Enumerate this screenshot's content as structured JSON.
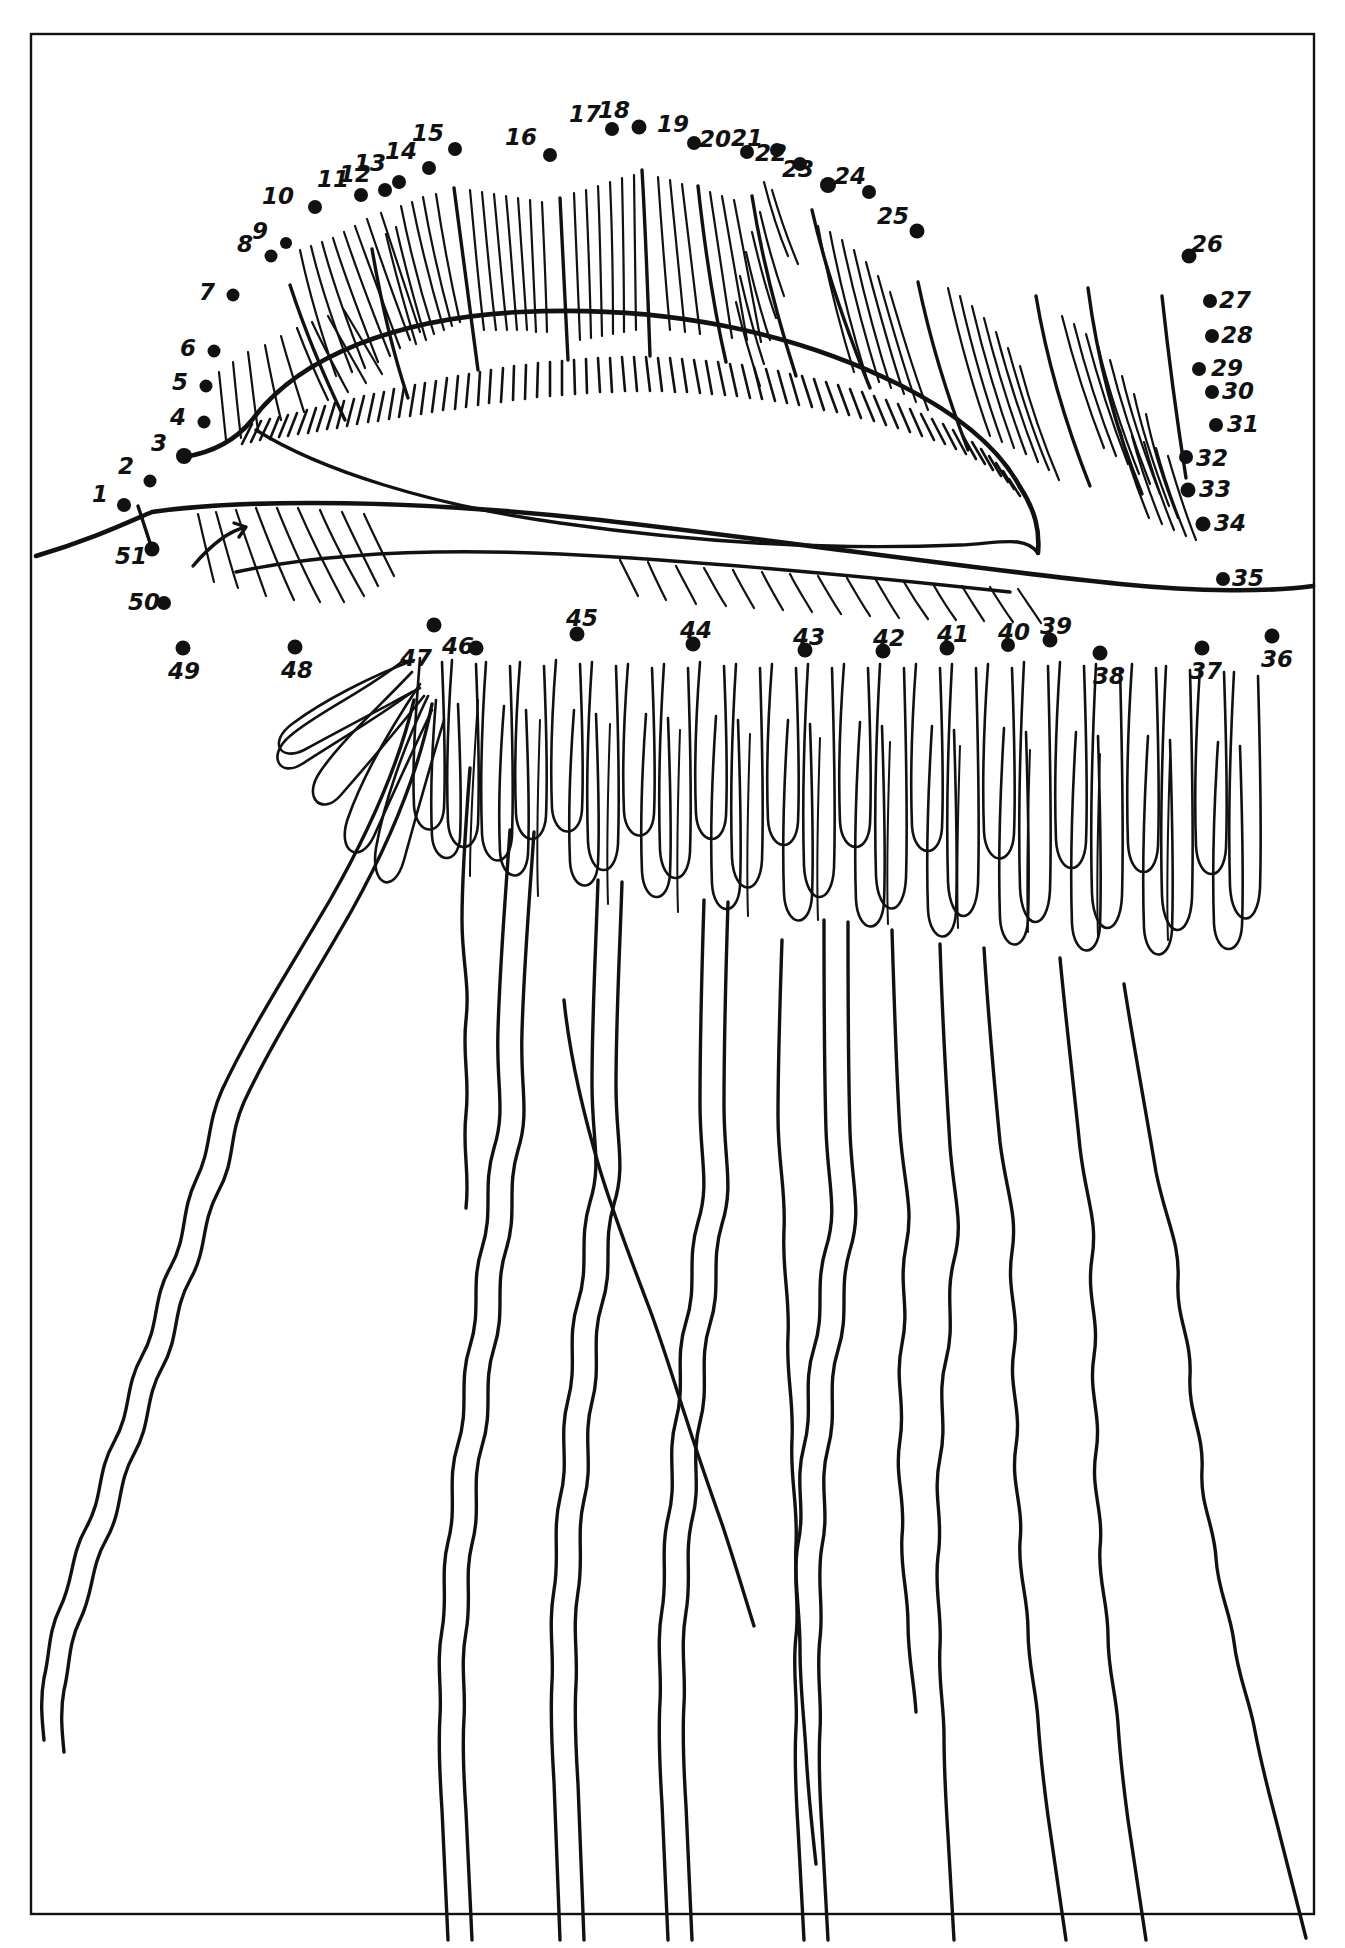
{
  "page": {
    "kind": "connect-the-dots-puzzle",
    "background_color": "#ffffff",
    "ink_color": "#111111",
    "border": {
      "present": true,
      "x": 30,
      "y": 33,
      "width": 1285,
      "height": 1882,
      "stroke": "#111111",
      "stroke_width": 2
    }
  },
  "subject": {
    "name": "jellyfish",
    "description": "Hand-drawn line art of a jellyfish: a broad domed bell with hatched rim at top, a row of short marginal tentacles, and long wavy trailing tentacles filling the lower two thirds of the frame."
  },
  "dots": [
    {
      "n": "1",
      "cx": 124,
      "cy": 505,
      "r": 7,
      "label_x": 108,
      "label_y": 483,
      "label_align": "right"
    },
    {
      "n": "2",
      "cx": 150,
      "cy": 481,
      "r": 6.5,
      "label_x": 134,
      "label_y": 455,
      "label_align": "right"
    },
    {
      "n": "3",
      "cx": 184,
      "cy": 456,
      "r": 8,
      "label_x": 167,
      "label_y": 432,
      "label_align": "right"
    },
    {
      "n": "4",
      "cx": 204,
      "cy": 422,
      "r": 6.5,
      "label_x": 186,
      "label_y": 406,
      "label_align": "right"
    },
    {
      "n": "5",
      "cx": 206,
      "cy": 386,
      "r": 6.5,
      "label_x": 188,
      "label_y": 371,
      "label_align": "right"
    },
    {
      "n": "6",
      "cx": 214,
      "cy": 351,
      "r": 6.5,
      "label_x": 196,
      "label_y": 337,
      "label_align": "right"
    },
    {
      "n": "7",
      "cx": 233,
      "cy": 295,
      "r": 6.5,
      "label_x": 215,
      "label_y": 281,
      "label_align": "right"
    },
    {
      "n": "8",
      "cx": 271,
      "cy": 256,
      "r": 6.5,
      "label_x": 253,
      "label_y": 233,
      "label_align": "right"
    },
    {
      "n": "9",
      "cx": 286,
      "cy": 243,
      "r": 6,
      "label_x": 268,
      "label_y": 220,
      "label_align": "right"
    },
    {
      "n": "10",
      "cx": 315,
      "cy": 207,
      "r": 7,
      "label_x": 294,
      "label_y": 185,
      "label_align": "right"
    },
    {
      "n": "11",
      "cx": 361,
      "cy": 195,
      "r": 7,
      "label_x": 349,
      "label_y": 168,
      "label_align": "right"
    },
    {
      "n": "12",
      "cx": 385,
      "cy": 190,
      "r": 7,
      "label_x": 371,
      "label_y": 163,
      "label_align": "right"
    },
    {
      "n": "13",
      "cx": 399,
      "cy": 182,
      "r": 7,
      "label_x": 386,
      "label_y": 152,
      "label_align": "right"
    },
    {
      "n": "14",
      "cx": 429,
      "cy": 168,
      "r": 7,
      "label_x": 417,
      "label_y": 140,
      "label_align": "right"
    },
    {
      "n": "15",
      "cx": 455,
      "cy": 149,
      "r": 7,
      "label_x": 444,
      "label_y": 122,
      "label_align": "right"
    },
    {
      "n": "16",
      "cx": 550,
      "cy": 155,
      "r": 7,
      "label_x": 537,
      "label_y": 126,
      "label_align": "right"
    },
    {
      "n": "17",
      "cx": 612,
      "cy": 129,
      "r": 7,
      "label_x": 601,
      "label_y": 103,
      "label_align": "right"
    },
    {
      "n": "18",
      "cx": 639,
      "cy": 127,
      "r": 7.5,
      "label_x": 630,
      "label_y": 99,
      "label_align": "right"
    },
    {
      "n": "19",
      "cx": 694,
      "cy": 143,
      "r": 7,
      "label_x": 689,
      "label_y": 113,
      "label_align": "right"
    },
    {
      "n": "20",
      "cx": 747,
      "cy": 152,
      "r": 7,
      "label_x": 731,
      "label_y": 128,
      "label_align": "right"
    },
    {
      "n": "21",
      "cx": 777,
      "cy": 150,
      "r": 7,
      "label_x": 763,
      "label_y": 127,
      "label_align": "right"
    },
    {
      "n": "22",
      "cx": 800,
      "cy": 164,
      "r": 7,
      "label_x": 787,
      "label_y": 142,
      "label_align": "right"
    },
    {
      "n": "23",
      "cx": 828,
      "cy": 185,
      "r": 8,
      "label_x": 814,
      "label_y": 158,
      "label_align": "right"
    },
    {
      "n": "24",
      "cx": 869,
      "cy": 192,
      "r": 7,
      "label_x": 866,
      "label_y": 165,
      "label_align": "right"
    },
    {
      "n": "25",
      "cx": 917,
      "cy": 231,
      "r": 7.5,
      "label_x": 909,
      "label_y": 205,
      "label_align": "right"
    },
    {
      "n": "26",
      "cx": 1189,
      "cy": 256,
      "r": 7.5,
      "label_x": 1191,
      "label_y": 233,
      "label_align": "left"
    },
    {
      "n": "27",
      "cx": 1210,
      "cy": 301,
      "r": 7,
      "label_x": 1219,
      "label_y": 289,
      "label_align": "left"
    },
    {
      "n": "28",
      "cx": 1212,
      "cy": 336,
      "r": 7,
      "label_x": 1221,
      "label_y": 324,
      "label_align": "left"
    },
    {
      "n": "29",
      "cx": 1199,
      "cy": 369,
      "r": 7,
      "label_x": 1211,
      "label_y": 357,
      "label_align": "left"
    },
    {
      "n": "30",
      "cx": 1212,
      "cy": 392,
      "r": 7,
      "label_x": 1222,
      "label_y": 380,
      "label_align": "left"
    },
    {
      "n": "31",
      "cx": 1216,
      "cy": 425,
      "r": 7,
      "label_x": 1227,
      "label_y": 413,
      "label_align": "left"
    },
    {
      "n": "32",
      "cx": 1186,
      "cy": 457,
      "r": 7,
      "label_x": 1196,
      "label_y": 447,
      "label_align": "left"
    },
    {
      "n": "33",
      "cx": 1188,
      "cy": 490,
      "r": 7.5,
      "label_x": 1199,
      "label_y": 478,
      "label_align": "left"
    },
    {
      "n": "34",
      "cx": 1203,
      "cy": 524,
      "r": 7.5,
      "label_x": 1214,
      "label_y": 512,
      "label_align": "left"
    },
    {
      "n": "35",
      "cx": 1223,
      "cy": 579,
      "r": 7,
      "label_x": 1232,
      "label_y": 567,
      "label_align": "left"
    },
    {
      "n": "36",
      "cx": 1272,
      "cy": 636,
      "r": 7.5,
      "label_x": 1261,
      "label_y": 648,
      "label_align": "left"
    },
    {
      "n": "37",
      "cx": 1202,
      "cy": 648,
      "r": 7.5,
      "label_x": 1190,
      "label_y": 660,
      "label_align": "left"
    },
    {
      "n": "38",
      "cx": 1100,
      "cy": 653,
      "r": 7.5,
      "label_x": 1093,
      "label_y": 665,
      "label_align": "left"
    },
    {
      "n": "39",
      "cx": 1050,
      "cy": 640,
      "r": 7.5,
      "label_x": 1040,
      "label_y": 615,
      "label_align": "left"
    },
    {
      "n": "40",
      "cx": 1008,
      "cy": 645,
      "r": 7,
      "label_x": 998,
      "label_y": 621,
      "label_align": "left"
    },
    {
      "n": "41",
      "cx": 947,
      "cy": 648,
      "r": 7.5,
      "label_x": 937,
      "label_y": 623,
      "label_align": "left"
    },
    {
      "n": "42",
      "cx": 883,
      "cy": 651,
      "r": 7.5,
      "label_x": 873,
      "label_y": 627,
      "label_align": "left"
    },
    {
      "n": "43",
      "cx": 805,
      "cy": 650,
      "r": 7.5,
      "label_x": 793,
      "label_y": 626,
      "label_align": "left"
    },
    {
      "n": "44",
      "cx": 693,
      "cy": 644,
      "r": 7.5,
      "label_x": 680,
      "label_y": 619,
      "label_align": "left"
    },
    {
      "n": "45",
      "cx": 577,
      "cy": 634,
      "r": 7.5,
      "label_x": 566,
      "label_y": 607,
      "label_align": "left"
    },
    {
      "n": "46",
      "cx": 476,
      "cy": 648,
      "r": 7.5,
      "label_x": 442,
      "label_y": 635,
      "label_align": "left"
    },
    {
      "n": "47",
      "cx": 434,
      "cy": 625,
      "r": 7.5,
      "label_x": 400,
      "label_y": 647,
      "label_align": "left"
    },
    {
      "n": "48",
      "cx": 295,
      "cy": 647,
      "r": 7.5,
      "label_x": 281,
      "label_y": 659,
      "label_align": "left"
    },
    {
      "n": "49",
      "cx": 183,
      "cy": 648,
      "r": 7.5,
      "label_x": 168,
      "label_y": 660,
      "label_align": "left"
    },
    {
      "n": "50",
      "cx": 164,
      "cy": 603,
      "r": 7,
      "label_x": 128,
      "label_y": 591,
      "label_align": "left"
    },
    {
      "n": "51",
      "cx": 152,
      "cy": 549,
      "r": 7.5,
      "label_x": 115,
      "label_y": 545,
      "label_align": "left"
    }
  ],
  "start_line": {
    "from": "51",
    "to": "1",
    "note": "short guide stroke drawn between dot 51 and dot 1"
  }
}
